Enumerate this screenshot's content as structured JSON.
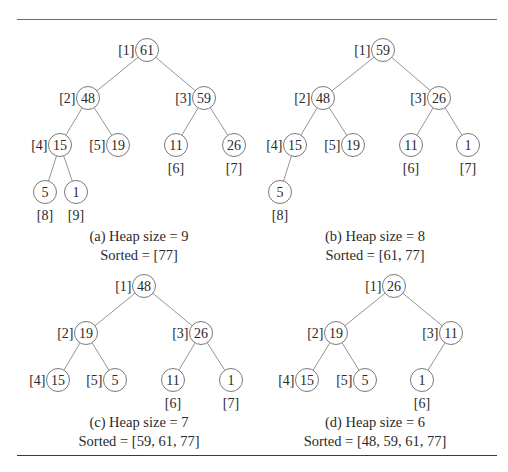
{
  "figure": {
    "node_radius": 11.5,
    "panels": [
      {
        "id": "a",
        "caption_line1": "(a) Heap size = 9",
        "caption_line2": "Sorted = [77]",
        "caption_x": 139,
        "caption_y1": 241,
        "caption_y2": 260,
        "heap_size": 9,
        "sorted": [
          77
        ],
        "nodes": [
          {
            "index": 1,
            "value": 61,
            "x": 147,
            "y": 50,
            "label": "[1]",
            "label_pos": "left"
          },
          {
            "index": 2,
            "value": 48,
            "x": 88,
            "y": 98,
            "label": "[2]",
            "label_pos": "left"
          },
          {
            "index": 3,
            "value": 59,
            "x": 204,
            "y": 98,
            "label": "[3]",
            "label_pos": "left"
          },
          {
            "index": 4,
            "value": 15,
            "x": 60,
            "y": 145,
            "label": "[4]",
            "label_pos": "left"
          },
          {
            "index": 5,
            "value": 19,
            "x": 118,
            "y": 145,
            "label": "[5]",
            "label_pos": "left"
          },
          {
            "index": 6,
            "value": 11,
            "x": 176,
            "y": 145,
            "label": "[6]",
            "label_pos": "below"
          },
          {
            "index": 7,
            "value": 26,
            "x": 234,
            "y": 145,
            "label": "[7]",
            "label_pos": "below"
          },
          {
            "index": 8,
            "value": 5,
            "x": 45,
            "y": 192,
            "label": "[8]",
            "label_pos": "below"
          },
          {
            "index": 9,
            "value": 1,
            "x": 76,
            "y": 192,
            "label": "[9]",
            "label_pos": "below"
          }
        ]
      },
      {
        "id": "b",
        "caption_line1": "(b) Heap size = 8",
        "caption_line2": "Sorted = [61, 77]",
        "caption_x": 375,
        "caption_y1": 241,
        "caption_y2": 260,
        "heap_size": 8,
        "sorted": [
          61,
          77
        ],
        "nodes": [
          {
            "index": 1,
            "value": 59,
            "x": 383,
            "y": 50,
            "label": "[1]",
            "label_pos": "left"
          },
          {
            "index": 2,
            "value": 48,
            "x": 323,
            "y": 98,
            "label": "[2]",
            "label_pos": "left"
          },
          {
            "index": 3,
            "value": 26,
            "x": 439,
            "y": 98,
            "label": "[3]",
            "label_pos": "left"
          },
          {
            "index": 4,
            "value": 15,
            "x": 295,
            "y": 145,
            "label": "[4]",
            "label_pos": "left"
          },
          {
            "index": 5,
            "value": 19,
            "x": 353,
            "y": 145,
            "label": "[5]",
            "label_pos": "left"
          },
          {
            "index": 6,
            "value": 11,
            "x": 411,
            "y": 145,
            "label": "[6]",
            "label_pos": "below"
          },
          {
            "index": 7,
            "value": 1,
            "x": 468,
            "y": 145,
            "label": "[7]",
            "label_pos": "below"
          },
          {
            "index": 8,
            "value": 5,
            "x": 280,
            "y": 192,
            "label": "[8]",
            "label_pos": "below"
          }
        ]
      },
      {
        "id": "c",
        "caption_line1": "(c) Heap size = 7",
        "caption_line2": "Sorted = [59, 61, 77]",
        "caption_x": 139,
        "caption_y1": 427,
        "caption_y2": 446,
        "heap_size": 7,
        "sorted": [
          59,
          61,
          77
        ],
        "nodes": [
          {
            "index": 1,
            "value": 48,
            "x": 144,
            "y": 286,
            "label": "[1]",
            "label_pos": "left"
          },
          {
            "index": 2,
            "value": 19,
            "x": 86,
            "y": 333,
            "label": "[2]",
            "label_pos": "left"
          },
          {
            "index": 3,
            "value": 26,
            "x": 201,
            "y": 333,
            "label": "[3]",
            "label_pos": "left"
          },
          {
            "index": 4,
            "value": 15,
            "x": 58,
            "y": 380,
            "label": "[4]",
            "label_pos": "left"
          },
          {
            "index": 5,
            "value": 5,
            "x": 115,
            "y": 380,
            "label": "[5]",
            "label_pos": "left"
          },
          {
            "index": 6,
            "value": 11,
            "x": 173,
            "y": 380,
            "label": "[6]",
            "label_pos": "below"
          },
          {
            "index": 7,
            "value": 1,
            "x": 231,
            "y": 380,
            "label": "[7]",
            "label_pos": "below"
          }
        ]
      },
      {
        "id": "d",
        "caption_line1": "(d) Heap size = 6",
        "caption_line2": "Sorted = [48, 59, 61, 77]",
        "caption_x": 375,
        "caption_y1": 427,
        "caption_y2": 446,
        "heap_size": 6,
        "sorted": [
          48,
          59,
          61,
          77
        ],
        "nodes": [
          {
            "index": 1,
            "value": 26,
            "x": 394,
            "y": 286,
            "label": "[1]",
            "label_pos": "left"
          },
          {
            "index": 2,
            "value": 19,
            "x": 336,
            "y": 333,
            "label": "[2]",
            "label_pos": "left"
          },
          {
            "index": 3,
            "value": 11,
            "x": 451,
            "y": 333,
            "label": "[3]",
            "label_pos": "left"
          },
          {
            "index": 4,
            "value": 15,
            "x": 307,
            "y": 380,
            "label": "[4]",
            "label_pos": "left"
          },
          {
            "index": 5,
            "value": 5,
            "x": 365,
            "y": 380,
            "label": "[5]",
            "label_pos": "left"
          },
          {
            "index": 6,
            "value": 1,
            "x": 422,
            "y": 380,
            "label": "[6]",
            "label_pos": "below"
          }
        ]
      }
    ]
  }
}
